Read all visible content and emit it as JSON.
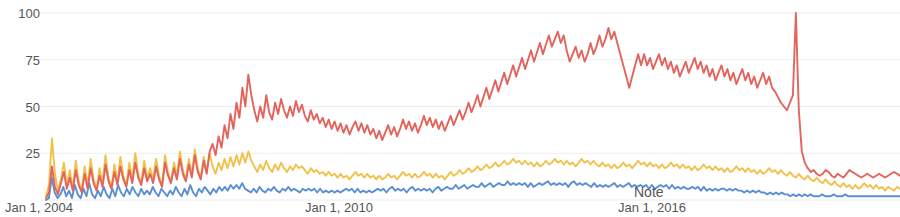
{
  "chart_data": {
    "type": "line",
    "title": "",
    "subtitle": "",
    "xlabel": "",
    "ylabel": "",
    "ylim": [
      0,
      100
    ],
    "grid": true,
    "grid_axis": "y",
    "legend": "none",
    "y_ticks": [
      100,
      75,
      50,
      25
    ],
    "y_tick_labels": [
      "100",
      "75",
      "50",
      "25"
    ],
    "x_tick_labels": [
      "Jan 1, 2004",
      "Jan 1, 2010",
      "Jan 1, 2016"
    ],
    "x_tick_positions": [
      0,
      0.5,
      0.78
    ],
    "annotations": [
      {
        "text": "Note",
        "x": 0.72,
        "y": 8
      }
    ],
    "colors": {
      "series_red": "#E2645C",
      "series_yellow": "#F2C14B",
      "series_blue": "#5B8FD4",
      "gridline": "#ededed",
      "axis_text": "#555555",
      "background": "#ffffff"
    },
    "series": [
      {
        "name": "series-red",
        "color": "#E2645C",
        "values": [
          1,
          4,
          18,
          7,
          3,
          9,
          15,
          6,
          12,
          5,
          16,
          8,
          4,
          14,
          6,
          17,
          9,
          5,
          13,
          7,
          19,
          10,
          6,
          15,
          8,
          18,
          11,
          7,
          16,
          9,
          20,
          12,
          8,
          17,
          10,
          14,
          9,
          18,
          11,
          7,
          20,
          13,
          9,
          17,
          11,
          22,
          14,
          10,
          19,
          12,
          24,
          15,
          11,
          21,
          14,
          26,
          30,
          24,
          34,
          28,
          40,
          33,
          46,
          38,
          52,
          44,
          60,
          50,
          67,
          56,
          48,
          42,
          50,
          44,
          56,
          47,
          43,
          52,
          46,
          54,
          48,
          44,
          50,
          45,
          53,
          47,
          51,
          45,
          42,
          48,
          43,
          46,
          41,
          44,
          39,
          43,
          38,
          42,
          37,
          41,
          36,
          40,
          35,
          39,
          42,
          37,
          41,
          36,
          40,
          35,
          38,
          33,
          37,
          32,
          36,
          40,
          35,
          39,
          34,
          38,
          43,
          38,
          42,
          37,
          41,
          36,
          40,
          45,
          40,
          44,
          39,
          43,
          38,
          42,
          37,
          41,
          45,
          40,
          44,
          48,
          43,
          47,
          52,
          47,
          51,
          56,
          50,
          55,
          60,
          54,
          59,
          64,
          58,
          63,
          68,
          62,
          67,
          72,
          66,
          71,
          76,
          70,
          75,
          80,
          74,
          79,
          84,
          78,
          83,
          88,
          82,
          86,
          90,
          84,
          88,
          80,
          74,
          78,
          82,
          76,
          80,
          74,
          78,
          84,
          78,
          82,
          88,
          82,
          86,
          92,
          86,
          90,
          84,
          78,
          72,
          66,
          60,
          66,
          72,
          78,
          72,
          78,
          72,
          76,
          70,
          74,
          78,
          72,
          76,
          70,
          74,
          68,
          72,
          66,
          70,
          74,
          68,
          72,
          76,
          70,
          74,
          68,
          72,
          66,
          70,
          64,
          68,
          72,
          66,
          70,
          64,
          68,
          62,
          66,
          70,
          64,
          68,
          62,
          66,
          60,
          64,
          68,
          62,
          66,
          60,
          58,
          55,
          52,
          50,
          48,
          52,
          56,
          100,
          48,
          26,
          20,
          17,
          15,
          16,
          14,
          13,
          14,
          16,
          15,
          13,
          12,
          14,
          13,
          12,
          14,
          16,
          15,
          14,
          13,
          12,
          13,
          14,
          13,
          12,
          13,
          14,
          13,
          12,
          13,
          14,
          15,
          14,
          13
        ]
      },
      {
        "name": "series-yellow",
        "color": "#F2C14B",
        "values": [
          2,
          8,
          33,
          14,
          5,
          11,
          20,
          8,
          16,
          6,
          21,
          10,
          5,
          18,
          8,
          22,
          11,
          6,
          17,
          9,
          24,
          12,
          7,
          19,
          10,
          23,
          13,
          8,
          20,
          11,
          25,
          14,
          9,
          21,
          12,
          17,
          11,
          22,
          13,
          8,
          24,
          15,
          10,
          20,
          13,
          26,
          16,
          11,
          22,
          14,
          27,
          17,
          12,
          23,
          15,
          25,
          18,
          14,
          20,
          16,
          22,
          17,
          23,
          18,
          24,
          19,
          25,
          20,
          26,
          21,
          18,
          15,
          19,
          16,
          21,
          17,
          15,
          19,
          16,
          20,
          17,
          15,
          18,
          16,
          19,
          17,
          18,
          16,
          14,
          17,
          15,
          16,
          14,
          15,
          13,
          15,
          13,
          14,
          12,
          14,
          12,
          13,
          11,
          13,
          15,
          13,
          14,
          12,
          14,
          12,
          13,
          11,
          13,
          11,
          12,
          14,
          12,
          13,
          11,
          13,
          15,
          13,
          14,
          12,
          14,
          12,
          13,
          15,
          13,
          14,
          12,
          14,
          12,
          13,
          11,
          13,
          15,
          13,
          14,
          16,
          14,
          15,
          17,
          15,
          16,
          18,
          16,
          17,
          19,
          17,
          18,
          20,
          18,
          19,
          21,
          19,
          20,
          22,
          20,
          21,
          19,
          21,
          19,
          20,
          18,
          20,
          18,
          19,
          21,
          19,
          20,
          22,
          20,
          21,
          19,
          21,
          19,
          20,
          18,
          20,
          22,
          20,
          21,
          19,
          21,
          19,
          18,
          20,
          18,
          19,
          17,
          19,
          17,
          18,
          20,
          18,
          19,
          17,
          19,
          21,
          19,
          20,
          18,
          20,
          18,
          19,
          17,
          19,
          17,
          18,
          20,
          18,
          19,
          17,
          19,
          17,
          18,
          16,
          18,
          16,
          17,
          19,
          17,
          18,
          16,
          18,
          16,
          17,
          15,
          17,
          15,
          16,
          18,
          16,
          17,
          15,
          17,
          15,
          16,
          14,
          16,
          14,
          15,
          17,
          15,
          16,
          14,
          16,
          14,
          13,
          15,
          13,
          12,
          14,
          12,
          11,
          13,
          11,
          10,
          12,
          10,
          9,
          11,
          9,
          8,
          10,
          8,
          7,
          9,
          7,
          8,
          6,
          8,
          6,
          7,
          9,
          7,
          8,
          6,
          8,
          6,
          7,
          5,
          7,
          6,
          5,
          7,
          6
        ]
      },
      {
        "name": "series-blue",
        "color": "#5B8FD4",
        "values": [
          0,
          1,
          12,
          4,
          1,
          3,
          7,
          2,
          5,
          1,
          8,
          3,
          1,
          6,
          2,
          9,
          3,
          1,
          5,
          2,
          7,
          3,
          1,
          6,
          2,
          8,
          4,
          2,
          6,
          3,
          7,
          4,
          2,
          6,
          3,
          5,
          3,
          7,
          4,
          2,
          6,
          4,
          2,
          5,
          3,
          7,
          4,
          2,
          6,
          3,
          8,
          4,
          2,
          6,
          4,
          7,
          5,
          3,
          6,
          4,
          7,
          5,
          7,
          5,
          8,
          6,
          8,
          6,
          9,
          6,
          5,
          4,
          6,
          4,
          7,
          5,
          4,
          6,
          5,
          7,
          5,
          4,
          6,
          5,
          7,
          5,
          6,
          5,
          4,
          6,
          5,
          6,
          5,
          6,
          4,
          6,
          4,
          5,
          4,
          5,
          4,
          5,
          4,
          5,
          6,
          5,
          6,
          4,
          6,
          4,
          5,
          4,
          5,
          4,
          5,
          6,
          5,
          6,
          4,
          6,
          7,
          5,
          6,
          5,
          6,
          4,
          6,
          7,
          5,
          6,
          5,
          6,
          5,
          6,
          4,
          6,
          7,
          5,
          6,
          7,
          6,
          6,
          8,
          6,
          7,
          8,
          6,
          7,
          8,
          7,
          7,
          9,
          7,
          8,
          9,
          7,
          8,
          9,
          8,
          8,
          10,
          8,
          9,
          8,
          9,
          8,
          9,
          7,
          9,
          7,
          8,
          9,
          8,
          9,
          10,
          8,
          9,
          8,
          9,
          8,
          9,
          7,
          9,
          10,
          8,
          9,
          8,
          9,
          8,
          7,
          9,
          7,
          8,
          7,
          8,
          7,
          8,
          9,
          7,
          8,
          7,
          8,
          9,
          7,
          8,
          7,
          8,
          7,
          8,
          6,
          8,
          6,
          7,
          8,
          7,
          8,
          6,
          8,
          6,
          7,
          6,
          7,
          6,
          6,
          7,
          6,
          7,
          5,
          7,
          5,
          6,
          5,
          6,
          5,
          6,
          6,
          5,
          6,
          5,
          6,
          5,
          5,
          4,
          5,
          4,
          5,
          4,
          5,
          4,
          4,
          3,
          4,
          3,
          4,
          3,
          4,
          3,
          3,
          2,
          3,
          2,
          3,
          2,
          3,
          2,
          3,
          2,
          2,
          2,
          3,
          2,
          2,
          2,
          3,
          2,
          2,
          2,
          3,
          2,
          2,
          2,
          2,
          2,
          2,
          2,
          2,
          2,
          2,
          2,
          2,
          2,
          2,
          2,
          2,
          2,
          2,
          2
        ]
      }
    ]
  }
}
